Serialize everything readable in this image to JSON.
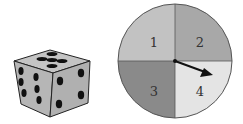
{
  "die": {
    "faces_visible": {
      "top": 5,
      "left": 6,
      "right": 4
    },
    "colors": {
      "top": "#c4c4c4",
      "left": "#b6b6b6",
      "right": "#b0b0b0",
      "pip": "#111111",
      "edge": "#222222"
    }
  },
  "spinner": {
    "sections": [
      {
        "label": "1",
        "color": "#c2c2c2"
      },
      {
        "label": "2",
        "color": "#a8a8a8"
      },
      {
        "label": "3",
        "color": "#8a8a8a"
      },
      {
        "label": "4",
        "color": "#e4e4e4"
      }
    ],
    "arrow_points_to": "4",
    "outline_color": "#555555",
    "arrow_color": "#111111"
  }
}
